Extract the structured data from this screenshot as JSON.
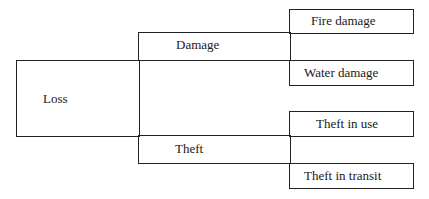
{
  "diagram": {
    "type": "hierarchical classification tree",
    "root": {
      "label": "Loss"
    },
    "branches": [
      {
        "label": "Damage",
        "children": [
          {
            "label": "Fire damage"
          },
          {
            "label": "Water damage"
          }
        ]
      },
      {
        "label": "Theft",
        "children": [
          {
            "label": "Theft in use"
          },
          {
            "label": "Theft in transit"
          }
        ]
      }
    ]
  },
  "colors": {
    "line": "#222222",
    "background": "#ffffff",
    "text": "#1a1a1a"
  }
}
